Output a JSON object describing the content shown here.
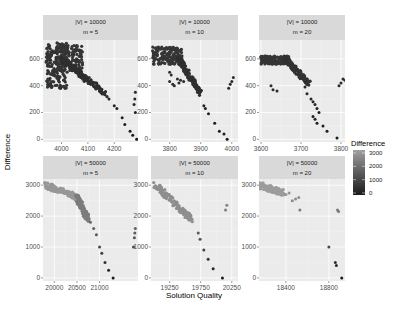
{
  "chart_data": {
    "type": "scatter",
    "layout": "facet_grid 2x3",
    "xlabel": "Solution Quality",
    "ylabel": "Difference",
    "legend": {
      "title": "Difference",
      "position": "right",
      "type": "continuous-gradient",
      "low_color": "#132b43",
      "high_color": "#56b1f7",
      "rendered_low_color": "#1a1a1a",
      "rendered_high_color": "#9a9a9a",
      "ticks": [
        0,
        1000,
        2000,
        3000
      ]
    },
    "grid": true,
    "panels": [
      {
        "strip": [
          "|V| = 10000",
          "m = 5"
        ],
        "xlim": [
          3930,
          4290
        ],
        "ylim": [
          -20,
          740
        ],
        "xticks": [
          4000,
          4100,
          4200
        ],
        "yticks": [
          0,
          200,
          400,
          600
        ],
        "clusters": [
          {
            "kind": "blob",
            "x": [
              3940,
              4020
            ],
            "y": [
              380,
              720
            ],
            "value": 550
          },
          {
            "kind": "blob",
            "x": [
              3980,
              4080
            ],
            "y": [
              500,
              700
            ],
            "value": 600
          },
          {
            "kind": "band",
            "from": [
              4000,
              600
            ],
            "to": [
              4170,
              330
            ],
            "value": 450
          }
        ],
        "points": [
          [
            4180,
            300
          ],
          [
            4200,
            250
          ],
          [
            4210,
            230
          ],
          [
            4230,
            160
          ],
          [
            4240,
            110
          ],
          [
            4260,
            60
          ],
          [
            4270,
            30
          ],
          [
            4285,
            0
          ],
          [
            4280,
            200
          ],
          [
            4275,
            260
          ],
          [
            4278,
            300
          ],
          [
            4280,
            350
          ]
        ]
      },
      {
        "strip": [
          "|V| = 10000",
          "m = 10"
        ],
        "xlim": [
          3740,
          4020
        ],
        "ylim": [
          -20,
          740
        ],
        "xticks": [
          3800,
          3900,
          4000
        ],
        "yticks": [
          0,
          200,
          400,
          600
        ],
        "clusters": [
          {
            "kind": "blob",
            "x": [
              3745,
              3840
            ],
            "y": [
              560,
              690
            ],
            "value": 620
          },
          {
            "kind": "band",
            "from": [
              3830,
              600
            ],
            "to": [
              3900,
              340
            ],
            "value": 480
          }
        ],
        "points": [
          [
            3800,
            500
          ],
          [
            3805,
            480
          ],
          [
            3800,
            430
          ],
          [
            3810,
            410
          ],
          [
            3815,
            400
          ],
          [
            3825,
            450
          ],
          [
            3835,
            440
          ],
          [
            3830,
            420
          ],
          [
            3845,
            430
          ],
          [
            3910,
            250
          ],
          [
            3915,
            230
          ],
          [
            3925,
            190
          ],
          [
            3945,
            120
          ],
          [
            3960,
            60
          ],
          [
            3975,
            40
          ],
          [
            3985,
            0
          ],
          [
            3990,
            380
          ],
          [
            3995,
            410
          ],
          [
            4000,
            430
          ],
          [
            4005,
            460
          ]
        ]
      },
      {
        "strip": [
          "|V| = 10000",
          "m = 20"
        ],
        "xlim": [
          3595,
          3810
        ],
        "ylim": [
          -20,
          740
        ],
        "xticks": [
          3600,
          3700,
          3800
        ],
        "yticks": [
          0,
          200,
          400,
          600
        ],
        "clusters": [
          {
            "kind": "blob",
            "x": [
              3600,
              3670
            ],
            "y": [
              560,
              620
            ],
            "value": 610
          },
          {
            "kind": "band",
            "from": [
              3660,
              600
            ],
            "to": [
              3720,
              420
            ],
            "value": 520
          }
        ],
        "points": [
          [
            3625,
            400
          ],
          [
            3630,
            370
          ],
          [
            3640,
            360
          ],
          [
            3710,
            390
          ],
          [
            3715,
            340
          ],
          [
            3725,
            300
          ],
          [
            3730,
            280
          ],
          [
            3735,
            260
          ],
          [
            3740,
            230
          ],
          [
            3745,
            200
          ],
          [
            3735,
            150
          ],
          [
            3730,
            170
          ],
          [
            3740,
            120
          ],
          [
            3755,
            100
          ],
          [
            3765,
            60
          ],
          [
            3790,
            10
          ],
          [
            3795,
            400
          ],
          [
            3800,
            420
          ],
          [
            3805,
            450
          ],
          [
            3810,
            440
          ]
        ]
      },
      {
        "strip": [
          "|V| = 50000",
          "m = 5"
        ],
        "xlim": [
          19750,
          21850
        ],
        "ylim": [
          -100,
          3200
        ],
        "xticks": [
          20000,
          20500,
          21000
        ],
        "yticks": [
          0,
          1000,
          2000,
          3000
        ],
        "clusters": [
          {
            "kind": "band",
            "from": [
              19800,
              3000
            ],
            "to": [
              20500,
              2600
            ],
            "value": 2800
          },
          {
            "kind": "band",
            "from": [
              20500,
              2600
            ],
            "to": [
              20750,
              1900
            ],
            "value": 2200
          }
        ],
        "points": [
          [
            20800,
            1800
          ],
          [
            20870,
            1600
          ],
          [
            20930,
            1400
          ],
          [
            21000,
            1000
          ],
          [
            21050,
            800
          ],
          [
            21120,
            500
          ],
          [
            21200,
            250
          ],
          [
            21300,
            0
          ],
          [
            21750,
            1000
          ],
          [
            21770,
            1300
          ],
          [
            21780,
            1450
          ],
          [
            21790,
            1600
          ]
        ]
      },
      {
        "strip": [
          "|V| = 50000",
          "m = 10"
        ],
        "xlim": [
          18950,
          20350
        ],
        "ylim": [
          -100,
          3200
        ],
        "xticks": [
          19250,
          19750,
          20250
        ],
        "yticks": [
          0,
          1000,
          2000,
          3000
        ],
        "clusters": [
          {
            "kind": "band",
            "from": [
              19000,
              3050
            ],
            "to": [
              19600,
              1900
            ],
            "value": 2600
          }
        ],
        "points": [
          [
            19710,
            1450
          ],
          [
            19740,
            1250
          ],
          [
            19800,
            900
          ],
          [
            19870,
            600
          ],
          [
            19950,
            300
          ],
          [
            20100,
            0
          ],
          [
            20150,
            2200
          ],
          [
            20170,
            2350
          ]
        ]
      },
      {
        "strip": [
          "|V| = 50000",
          "m = 20"
        ],
        "xlim": [
          18150,
          18950
        ],
        "ylim": [
          -100,
          3200
        ],
        "xticks": [
          18400,
          18800
        ],
        "yticks": [
          0,
          1000,
          2000,
          3000
        ],
        "clusters": [
          {
            "kind": "band",
            "from": [
              18150,
              3000
            ],
            "to": [
              18380,
              2750
            ],
            "value": 2900
          }
        ],
        "points": [
          [
            18400,
            2700
          ],
          [
            18430,
            2750
          ],
          [
            18460,
            2500
          ],
          [
            18490,
            2550
          ],
          [
            18520,
            2600
          ],
          [
            18530,
            2200
          ],
          [
            18880,
            2200
          ],
          [
            18890,
            2150
          ],
          [
            18800,
            1000
          ],
          [
            18860,
            500
          ],
          [
            18870,
            400
          ],
          [
            18920,
            0
          ]
        ]
      }
    ]
  }
}
